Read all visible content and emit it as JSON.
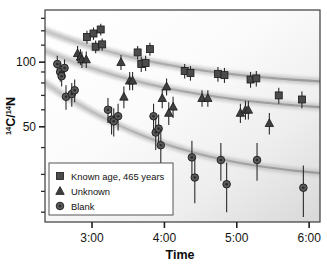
{
  "chart_data": {
    "type": "scatter",
    "title": "",
    "xlabel": "Time",
    "ylabel": "14C/14N",
    "ylabel_parts": {
      "sup1": "14",
      "mid": "C/",
      "sup2": "14",
      "end": "N"
    },
    "xscale": "linear",
    "yscale": "log",
    "xlim": [
      2.35,
      6.15
    ],
    "ylim": [
      18,
      175
    ],
    "grid": false,
    "legend_position": "lower-left",
    "xticks": [
      3,
      4,
      5,
      6
    ],
    "xticklabels": [
      "3:00",
      "4:00",
      "5:00",
      "6:00"
    ],
    "yticks": [
      50,
      100
    ],
    "yticklabels": [
      "50",
      "100"
    ],
    "yminorticks": [
      20,
      25,
      30,
      40,
      60,
      70,
      80,
      90,
      120,
      140,
      160
    ],
    "series": [
      {
        "name": "Known age, 465 years",
        "marker": "square",
        "color": "#4b4b4b",
        "points": [
          {
            "x": 2.93,
            "y": 131,
            "err": 9
          },
          {
            "x": 3.02,
            "y": 136,
            "err": 9
          },
          {
            "x": 3.05,
            "y": 118,
            "err": 8
          },
          {
            "x": 3.12,
            "y": 142,
            "err": 9
          },
          {
            "x": 3.14,
            "y": 121,
            "err": 8
          },
          {
            "x": 3.63,
            "y": 111,
            "err": 8
          },
          {
            "x": 3.68,
            "y": 98,
            "err": 8
          },
          {
            "x": 3.74,
            "y": 99,
            "err": 8
          },
          {
            "x": 3.8,
            "y": 115,
            "err": 8
          },
          {
            "x": 4.28,
            "y": 91,
            "err": 7
          },
          {
            "x": 4.36,
            "y": 89,
            "err": 7
          },
          {
            "x": 4.74,
            "y": 88,
            "err": 7
          },
          {
            "x": 4.83,
            "y": 87,
            "err": 7
          },
          {
            "x": 5.19,
            "y": 83,
            "err": 7
          },
          {
            "x": 5.27,
            "y": 84,
            "err": 7
          },
          {
            "x": 5.58,
            "y": 70,
            "err": 6
          },
          {
            "x": 5.9,
            "y": 67,
            "err": 6
          }
        ]
      },
      {
        "name": "Unknown",
        "marker": "triangle",
        "color": "#3f3f3f",
        "points": [
          {
            "x": 2.8,
            "y": 110,
            "err": 9
          },
          {
            "x": 2.84,
            "y": 106,
            "err": 9
          },
          {
            "x": 2.86,
            "y": 103,
            "err": 9
          },
          {
            "x": 2.92,
            "y": 103,
            "err": 9
          },
          {
            "x": 3.4,
            "y": 100,
            "err": 8
          },
          {
            "x": 3.44,
            "y": 69,
            "err": 8
          },
          {
            "x": 3.52,
            "y": 82,
            "err": 8
          },
          {
            "x": 3.56,
            "y": 82,
            "err": 8
          },
          {
            "x": 3.97,
            "y": 68,
            "err": 7
          },
          {
            "x": 4.03,
            "y": 77,
            "err": 7
          },
          {
            "x": 4.06,
            "y": 58,
            "err": 7
          },
          {
            "x": 4.12,
            "y": 62,
            "err": 7
          },
          {
            "x": 4.52,
            "y": 68,
            "err": 6
          },
          {
            "x": 4.6,
            "y": 68,
            "err": 6
          },
          {
            "x": 5.05,
            "y": 58,
            "err": 6
          },
          {
            "x": 5.12,
            "y": 60,
            "err": 6
          },
          {
            "x": 5.16,
            "y": 60,
            "err": 6
          },
          {
            "x": 5.45,
            "y": 52,
            "err": 6
          }
        ]
      },
      {
        "name": "Blank",
        "marker": "circle",
        "color": "#5a5a5a",
        "points": [
          {
            "x": 2.52,
            "y": 98,
            "err": 9
          },
          {
            "x": 2.56,
            "y": 90,
            "err": 9
          },
          {
            "x": 2.58,
            "y": 86,
            "err": 9
          },
          {
            "x": 2.62,
            "y": 94,
            "err": 9
          },
          {
            "x": 2.64,
            "y": 69,
            "err": 9
          },
          {
            "x": 2.72,
            "y": 71,
            "err": 9
          },
          {
            "x": 2.76,
            "y": 74,
            "err": 9
          },
          {
            "x": 3.22,
            "y": 60,
            "err": 8
          },
          {
            "x": 3.27,
            "y": 54,
            "err": 8
          },
          {
            "x": 3.3,
            "y": 53,
            "err": 8
          },
          {
            "x": 3.36,
            "y": 56,
            "err": 8
          },
          {
            "x": 3.85,
            "y": 56,
            "err": 8
          },
          {
            "x": 3.88,
            "y": 47,
            "err": 8
          },
          {
            "x": 3.92,
            "y": 49,
            "err": 8
          },
          {
            "x": 3.95,
            "y": 41,
            "err": 8
          },
          {
            "x": 4.38,
            "y": 36,
            "err": 7
          },
          {
            "x": 4.42,
            "y": 29,
            "err": 7
          },
          {
            "x": 4.78,
            "y": 35,
            "err": 7
          },
          {
            "x": 4.86,
            "y": 27,
            "err": 7
          },
          {
            "x": 5.28,
            "y": 35,
            "err": 7
          },
          {
            "x": 5.92,
            "y": 26,
            "err": 7
          }
        ]
      }
    ],
    "trend_curves": [
      {
        "name": "known-age-trend",
        "y0": 140,
        "y1": 76,
        "k": 0.42
      },
      {
        "name": "unknown-trend",
        "y0": 113,
        "y1": 57,
        "k": 0.42
      },
      {
        "name": "blank-trend",
        "y0": 80,
        "y1": 28,
        "k": 0.52
      }
    ]
  },
  "legend": {
    "entries": [
      {
        "label": "Known age, 465 years",
        "marker": "square"
      },
      {
        "label": "Unknown",
        "marker": "triangle"
      },
      {
        "label": "Blank",
        "marker": "circle"
      }
    ]
  }
}
